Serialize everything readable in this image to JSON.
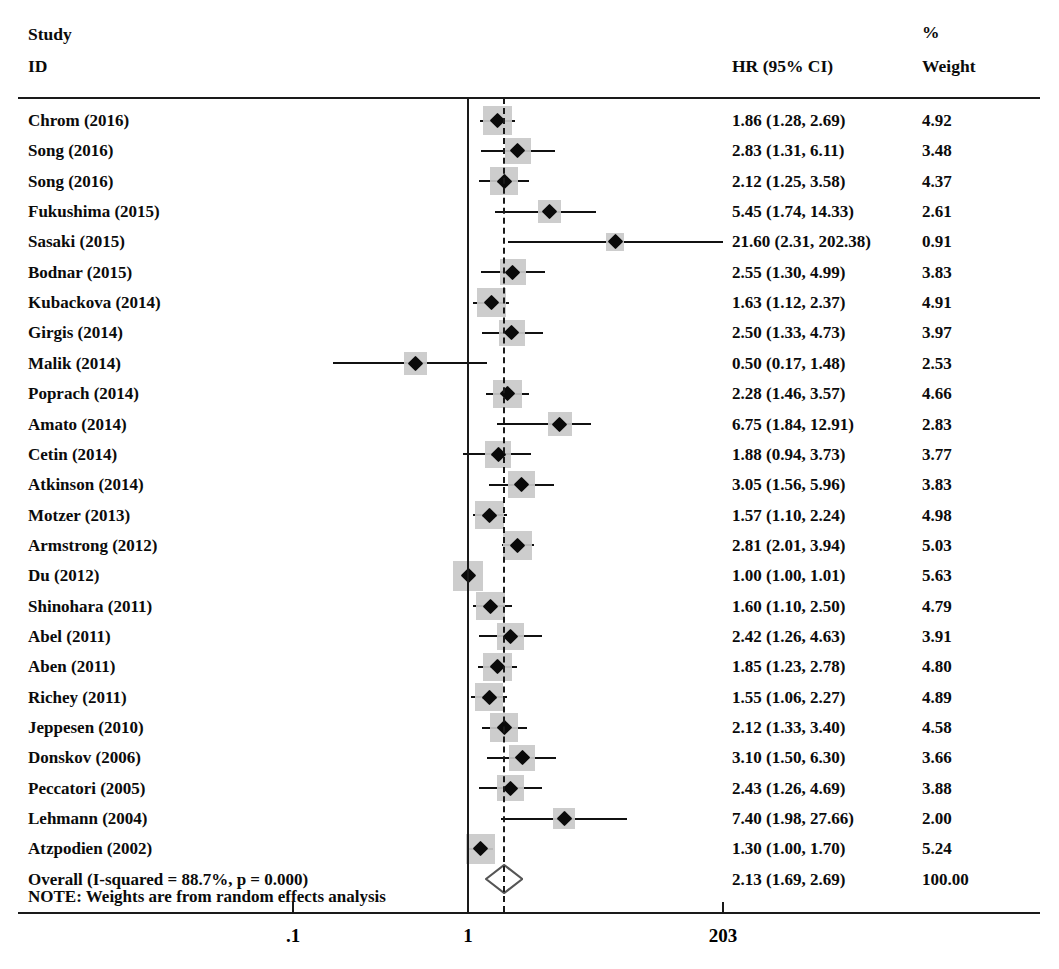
{
  "header": {
    "col_study_line1": "Study",
    "col_study_line2": "ID",
    "col_hr": "HR (95% CI)",
    "col_weight_line1": "%",
    "col_weight_line2": "Weight"
  },
  "note": "NOTE: Weights are from random effects analysis",
  "overall_label": "Overall  (I-squared = 88.7%, p = 0.000)",
  "overall_hr_text": "2.13 (1.69, 2.69)",
  "overall_weight_text": "100.00",
  "colors": {
    "marker": "#0a0a0a",
    "weight_box": "#c9c9c9",
    "axis": "#1a1a1a",
    "background": "#ffffff"
  },
  "axis": {
    "ticks": [
      {
        "label": ".1",
        "value": 0.1
      },
      {
        "label": "1",
        "value": 1
      },
      {
        "label": "203",
        "value": 203
      }
    ],
    "null_value": 1,
    "pooled_value": 2.13
  },
  "chart_data": {
    "type": "forest",
    "title": "",
    "xlabel": "",
    "ylabel": "",
    "effect_measure": "HR (95% CI)",
    "scale": "log",
    "xlim": [
      0.1,
      203
    ],
    "grid": false,
    "null_line": 1,
    "pooled_line": 2.13,
    "heterogeneity": "I-squared = 88.7%, p = 0.000",
    "model": "random effects",
    "columns": [
      "Study ID",
      "HR (95% CI)",
      "% Weight"
    ],
    "rows": [
      {
        "study": "Chrom (2016)",
        "hr": 1.86,
        "lower": 1.28,
        "upper": 2.69,
        "hr_text": "1.86 (1.28, 2.69)",
        "weight": 4.92,
        "weight_text": "4.92"
      },
      {
        "study": "Song (2016)",
        "hr": 2.83,
        "lower": 1.31,
        "upper": 6.11,
        "hr_text": "2.83 (1.31, 6.11)",
        "weight": 3.48,
        "weight_text": "3.48"
      },
      {
        "study": "Song (2016)",
        "hr": 2.12,
        "lower": 1.25,
        "upper": 3.58,
        "hr_text": "2.12 (1.25, 3.58)",
        "weight": 4.37,
        "weight_text": "4.37"
      },
      {
        "study": "Fukushima (2015)",
        "hr": 5.45,
        "lower": 1.74,
        "upper": 14.33,
        "hr_text": "5.45 (1.74, 14.33)",
        "weight": 2.61,
        "weight_text": "2.61"
      },
      {
        "study": "Sasaki (2015)",
        "hr": 21.6,
        "lower": 2.31,
        "upper": 202.38,
        "hr_text": "21.60 (2.31, 202.38)",
        "weight": 0.91,
        "weight_text": "0.91"
      },
      {
        "study": "Bodnar (2015)",
        "hr": 2.55,
        "lower": 1.3,
        "upper": 4.99,
        "hr_text": "2.55 (1.30, 4.99)",
        "weight": 3.83,
        "weight_text": "3.83"
      },
      {
        "study": "Kubackova (2014)",
        "hr": 1.63,
        "lower": 1.12,
        "upper": 2.37,
        "hr_text": "1.63 (1.12, 2.37)",
        "weight": 4.91,
        "weight_text": "4.91"
      },
      {
        "study": "Girgis (2014)",
        "hr": 2.5,
        "lower": 1.33,
        "upper": 4.73,
        "hr_text": "2.50 (1.33, 4.73)",
        "weight": 3.97,
        "weight_text": "3.97"
      },
      {
        "study": "Malik (2014)",
        "hr": 0.5,
        "lower": 0.17,
        "upper": 1.48,
        "hr_text": "0.50 (0.17, 1.48)",
        "weight": 2.53,
        "weight_text": "2.53"
      },
      {
        "study": "Poprach (2014)",
        "hr": 2.28,
        "lower": 1.46,
        "upper": 3.57,
        "hr_text": "2.28 (1.46, 3.57)",
        "weight": 4.66,
        "weight_text": "4.66"
      },
      {
        "study": "Amato (2014)",
        "hr": 6.75,
        "lower": 1.84,
        "upper": 12.91,
        "hr_text": "6.75 (1.84, 12.91)",
        "weight": 2.83,
        "weight_text": "2.83"
      },
      {
        "study": "Cetin (2014)",
        "hr": 1.88,
        "lower": 0.94,
        "upper": 3.73,
        "hr_text": "1.88 (0.94, 3.73)",
        "weight": 3.77,
        "weight_text": "3.77"
      },
      {
        "study": "Atkinson (2014)",
        "hr": 3.05,
        "lower": 1.56,
        "upper": 5.96,
        "hr_text": "3.05 (1.56, 5.96)",
        "weight": 3.83,
        "weight_text": "3.83"
      },
      {
        "study": "Motzer (2013)",
        "hr": 1.57,
        "lower": 1.1,
        "upper": 2.24,
        "hr_text": "1.57 (1.10, 2.24)",
        "weight": 4.98,
        "weight_text": "4.98"
      },
      {
        "study": "Armstrong (2012)",
        "hr": 2.81,
        "lower": 2.01,
        "upper": 3.94,
        "hr_text": "2.81 (2.01, 3.94)",
        "weight": 5.03,
        "weight_text": "5.03"
      },
      {
        "study": "Du (2012)",
        "hr": 1.0,
        "lower": 1.0,
        "upper": 1.01,
        "hr_text": "1.00 (1.00, 1.01)",
        "weight": 5.63,
        "weight_text": "5.63"
      },
      {
        "study": "Shinohara (2011)",
        "hr": 1.6,
        "lower": 1.1,
        "upper": 2.5,
        "hr_text": "1.60 (1.10, 2.50)",
        "weight": 4.79,
        "weight_text": "4.79"
      },
      {
        "study": "Abel (2011)",
        "hr": 2.42,
        "lower": 1.26,
        "upper": 4.63,
        "hr_text": "2.42 (1.26, 4.63)",
        "weight": 3.91,
        "weight_text": "3.91"
      },
      {
        "study": "Aben (2011)",
        "hr": 1.85,
        "lower": 1.23,
        "upper": 2.78,
        "hr_text": "1.85 (1.23, 2.78)",
        "weight": 4.8,
        "weight_text": "4.80"
      },
      {
        "study": "Richey (2011)",
        "hr": 1.55,
        "lower": 1.06,
        "upper": 2.27,
        "hr_text": "1.55 (1.06, 2.27)",
        "weight": 4.89,
        "weight_text": "4.89"
      },
      {
        "study": "Jeppesen (2010)",
        "hr": 2.12,
        "lower": 1.33,
        "upper": 3.4,
        "hr_text": "2.12 (1.33, 3.40)",
        "weight": 4.58,
        "weight_text": "4.58"
      },
      {
        "study": "Donskov (2006)",
        "hr": 3.1,
        "lower": 1.5,
        "upper": 6.3,
        "hr_text": "3.10 (1.50, 6.30)",
        "weight": 3.66,
        "weight_text": "3.66"
      },
      {
        "study": "Peccatori (2005)",
        "hr": 2.43,
        "lower": 1.26,
        "upper": 4.69,
        "hr_text": "2.43 (1.26, 4.69)",
        "weight": 3.88,
        "weight_text": "3.88"
      },
      {
        "study": "Lehmann (2004)",
        "hr": 7.4,
        "lower": 1.98,
        "upper": 27.66,
        "hr_text": "7.40 (1.98, 27.66)",
        "weight": 2.0,
        "weight_text": "2.00"
      },
      {
        "study": "Atzpodien (2002)",
        "hr": 1.3,
        "lower": 1.0,
        "upper": 1.7,
        "hr_text": "1.30 (1.00, 1.70)",
        "weight": 5.24,
        "weight_text": "5.24"
      }
    ],
    "overall": {
      "study": "Overall  (I-squared = 88.7%, p = 0.000)",
      "hr": 2.13,
      "lower": 1.69,
      "upper": 2.69,
      "hr_text": "2.13 (1.69, 2.69)",
      "weight": 100.0,
      "weight_text": "100.00"
    }
  }
}
